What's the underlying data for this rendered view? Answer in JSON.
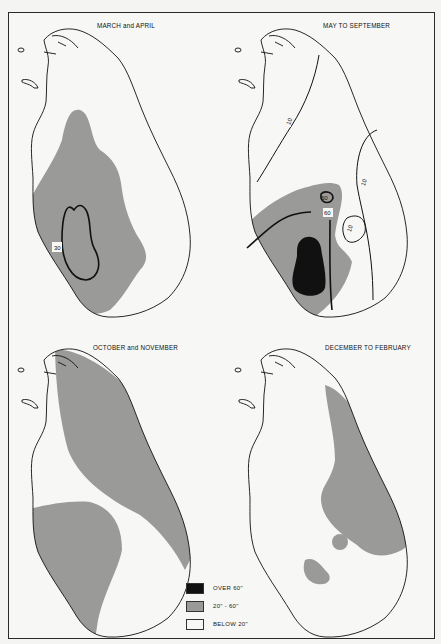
{
  "figure": {
    "panels": [
      {
        "id": "march-april",
        "title": "MARCH and APRIL",
        "isohyets": [
          "30\""
        ]
      },
      {
        "id": "may-september",
        "title": "MAY TO SEPTEMBER",
        "isohyets": [
          "10\"",
          "10\"",
          "10\"",
          "60\"",
          "60\""
        ]
      },
      {
        "id": "october-november",
        "title": "OCTOBER and NOVEMBER",
        "isohyets": []
      },
      {
        "id": "december-february",
        "title": "DECEMBER TO FEBRUARY",
        "isohyets": []
      }
    ],
    "labels": {
      "p1_iso": "30",
      "p2_iso_a": "10",
      "p2_iso_b": "10",
      "p2_iso_c": "10",
      "p2_iso_d": "60",
      "p2_iso_e": "60"
    }
  },
  "legend": {
    "items": [
      {
        "label": "OVER 60\"",
        "color": "#111111"
      },
      {
        "label": "20\" - 60\"",
        "color": "#9a9a98"
      },
      {
        "label": "BELOW 20\"",
        "color": "#f7f7f5"
      }
    ]
  },
  "colors": {
    "over60": "#111111",
    "mid": "#9a9a98",
    "below20": "#f7f7f5",
    "line": "#111111"
  }
}
